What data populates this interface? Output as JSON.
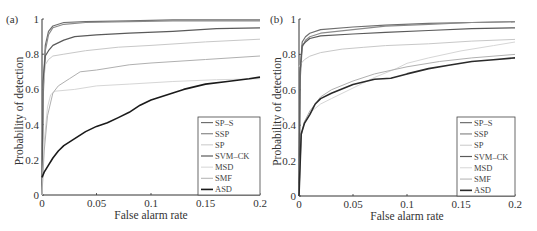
{
  "chart_data": [
    {
      "type": "line",
      "panel_label": "(a)",
      "title": "",
      "xlabel": "False alarm rate",
      "ylabel": "Probability of detection",
      "xlim": [
        0,
        0.2
      ],
      "ylim": [
        0,
        1
      ],
      "xticks": [
        "0",
        "0.05",
        "0.1",
        "0.15",
        "0.2"
      ],
      "yticks": [
        "0",
        "0.2",
        "0.4",
        "0.6",
        "0.8",
        "1"
      ],
      "grid": false,
      "legend_position": "lower right",
      "series": [
        {
          "name": "SP–S",
          "color": "#6e6e6e",
          "width": 1.2,
          "x": [
            0,
            0.001,
            0.003,
            0.006,
            0.01,
            0.02,
            0.04,
            0.08,
            0.12,
            0.2
          ],
          "y": [
            0,
            0.6,
            0.85,
            0.93,
            0.96,
            0.98,
            0.985,
            0.99,
            0.995,
            0.995
          ]
        },
        {
          "name": "SSP",
          "color": "#8a8a8a",
          "width": 1.2,
          "x": [
            0,
            0.001,
            0.003,
            0.006,
            0.01,
            0.02,
            0.04,
            0.08,
            0.12,
            0.2
          ],
          "y": [
            0,
            0.55,
            0.82,
            0.91,
            0.95,
            0.97,
            0.98,
            0.985,
            0.99,
            0.99
          ]
        },
        {
          "name": "SP",
          "color": "#c8c8c8",
          "width": 1.0,
          "x": [
            0,
            0.001,
            0.003,
            0.006,
            0.01,
            0.02,
            0.04,
            0.07,
            0.1,
            0.15,
            0.2
          ],
          "y": [
            0,
            0.6,
            0.74,
            0.77,
            0.79,
            0.8,
            0.82,
            0.84,
            0.85,
            0.87,
            0.885
          ]
        },
        {
          "name": "SVM–CK",
          "color": "#5a5a5a",
          "width": 1.2,
          "x": [
            0,
            0.001,
            0.003,
            0.006,
            0.01,
            0.02,
            0.03,
            0.05,
            0.08,
            0.12,
            0.16,
            0.2
          ],
          "y": [
            0,
            0.65,
            0.79,
            0.82,
            0.85,
            0.88,
            0.9,
            0.91,
            0.92,
            0.93,
            0.945,
            0.95
          ]
        },
        {
          "name": "MSD",
          "color": "#d6d6d6",
          "width": 1.0,
          "x": [
            0,
            0.002,
            0.005,
            0.008,
            0.012,
            0.03,
            0.05,
            0.08,
            0.12,
            0.16,
            0.2
          ],
          "y": [
            0,
            0.3,
            0.5,
            0.57,
            0.59,
            0.6,
            0.62,
            0.63,
            0.645,
            0.655,
            0.66
          ]
        },
        {
          "name": "SMF",
          "color": "#b0b0b0",
          "width": 1.0,
          "x": [
            0,
            0.002,
            0.005,
            0.01,
            0.015,
            0.025,
            0.035,
            0.05,
            0.08,
            0.1,
            0.15,
            0.2
          ],
          "y": [
            0,
            0.25,
            0.45,
            0.58,
            0.62,
            0.66,
            0.7,
            0.71,
            0.74,
            0.75,
            0.77,
            0.79
          ]
        },
        {
          "name": "ASD",
          "color": "#1a1a1a",
          "width": 1.6,
          "x": [
            0,
            0.002,
            0.006,
            0.01,
            0.015,
            0.02,
            0.03,
            0.04,
            0.05,
            0.06,
            0.07,
            0.08,
            0.09,
            0.1,
            0.11,
            0.12,
            0.13,
            0.15,
            0.17,
            0.19,
            0.2
          ],
          "y": [
            0.1,
            0.13,
            0.17,
            0.21,
            0.25,
            0.28,
            0.32,
            0.36,
            0.39,
            0.41,
            0.44,
            0.47,
            0.51,
            0.54,
            0.56,
            0.58,
            0.6,
            0.63,
            0.645,
            0.66,
            0.67
          ]
        }
      ]
    },
    {
      "type": "line",
      "panel_label": "(b)",
      "title": "",
      "xlabel": "False alarm rate",
      "ylabel": "Probability of detection",
      "xlim": [
        0,
        0.2
      ],
      "ylim": [
        0,
        1
      ],
      "xticks": [
        "0",
        "0.05",
        "0.1",
        "0.15",
        "0.2"
      ],
      "yticks": [
        "0",
        "0.2",
        "0.4",
        "0.6",
        "0.8",
        "1"
      ],
      "grid": false,
      "legend_position": "lower right",
      "series": [
        {
          "name": "SP–S",
          "color": "#6e6e6e",
          "width": 1.2,
          "x": [
            0,
            0.001,
            0.003,
            0.006,
            0.01,
            0.02,
            0.05,
            0.08,
            0.12,
            0.16,
            0.2
          ],
          "y": [
            0,
            0.7,
            0.87,
            0.9,
            0.92,
            0.94,
            0.955,
            0.965,
            0.975,
            0.98,
            0.985
          ]
        },
        {
          "name": "SSP",
          "color": "#8a8a8a",
          "width": 1.2,
          "x": [
            0,
            0.001,
            0.003,
            0.006,
            0.01,
            0.02,
            0.05,
            0.08,
            0.12,
            0.16,
            0.2
          ],
          "y": [
            0,
            0.65,
            0.84,
            0.88,
            0.9,
            0.92,
            0.94,
            0.96,
            0.97,
            0.98,
            0.985
          ]
        },
        {
          "name": "SP",
          "color": "#c8c8c8",
          "width": 1.0,
          "x": [
            0,
            0.002,
            0.005,
            0.01,
            0.02,
            0.04,
            0.06,
            0.08,
            0.12,
            0.16,
            0.2
          ],
          "y": [
            0.73,
            0.75,
            0.77,
            0.79,
            0.81,
            0.83,
            0.84,
            0.85,
            0.86,
            0.875,
            0.885
          ]
        },
        {
          "name": "SVM–CK",
          "color": "#5a5a5a",
          "width": 1.2,
          "x": [
            0,
            0.001,
            0.003,
            0.006,
            0.01,
            0.02,
            0.05,
            0.08,
            0.12,
            0.16,
            0.2
          ],
          "y": [
            0,
            0.7,
            0.85,
            0.87,
            0.89,
            0.905,
            0.915,
            0.925,
            0.935,
            0.945,
            0.95
          ]
        },
        {
          "name": "MSD",
          "color": "#d6d6d6",
          "width": 1.0,
          "x": [
            0,
            0.002,
            0.005,
            0.01,
            0.02,
            0.03,
            0.05,
            0.07,
            0.09,
            0.1,
            0.12,
            0.15,
            0.18,
            0.2
          ],
          "y": [
            0,
            0.34,
            0.42,
            0.47,
            0.52,
            0.55,
            0.61,
            0.67,
            0.72,
            0.75,
            0.78,
            0.82,
            0.85,
            0.87
          ]
        },
        {
          "name": "SMF",
          "color": "#b0b0b0",
          "width": 1.0,
          "x": [
            0,
            0.002,
            0.005,
            0.01,
            0.02,
            0.03,
            0.05,
            0.07,
            0.1,
            0.13,
            0.16,
            0.2
          ],
          "y": [
            0,
            0.34,
            0.42,
            0.48,
            0.56,
            0.6,
            0.65,
            0.69,
            0.73,
            0.76,
            0.78,
            0.8
          ]
        },
        {
          "name": "ASD",
          "color": "#2a2a2a",
          "width": 1.6,
          "x": [
            0,
            0.002,
            0.005,
            0.01,
            0.015,
            0.02,
            0.03,
            0.05,
            0.07,
            0.085,
            0.1,
            0.12,
            0.14,
            0.16,
            0.18,
            0.2
          ],
          "y": [
            0,
            0.35,
            0.41,
            0.46,
            0.52,
            0.55,
            0.58,
            0.63,
            0.66,
            0.665,
            0.69,
            0.72,
            0.74,
            0.76,
            0.77,
            0.78
          ]
        }
      ]
    }
  ]
}
